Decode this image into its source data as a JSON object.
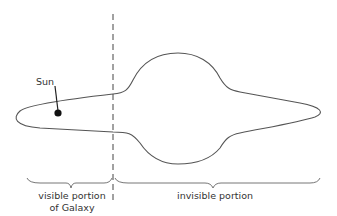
{
  "diagram": {
    "labels": {
      "sun": "Sun",
      "visible_line1": "visible portion",
      "visible_line2": "of Galaxy",
      "invisible": "invisible portion"
    },
    "colors": {
      "stroke": "#555555",
      "sun": "#111111",
      "text": "#333333"
    }
  }
}
